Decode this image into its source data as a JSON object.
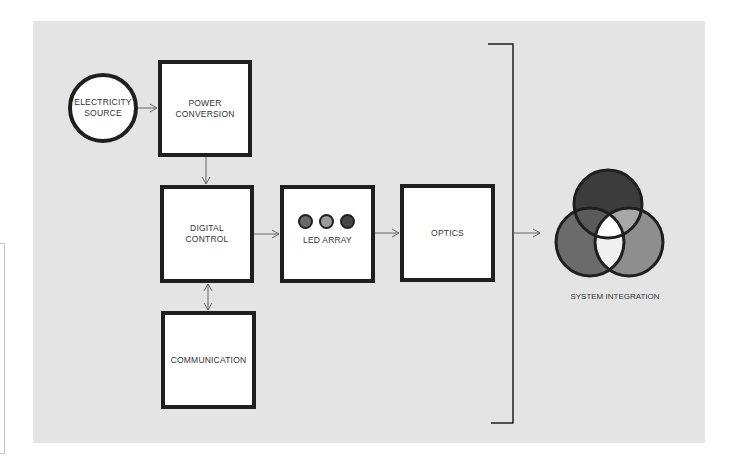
{
  "diagram": {
    "nodes": {
      "electricity_source": {
        "label": "ELECTRICITY\nSOURCE",
        "shape": "circle"
      },
      "power_conversion": {
        "label": "POWER\nCONVERSION",
        "shape": "box"
      },
      "digital_control": {
        "label": "DIGITAL\nCONTROL",
        "shape": "box"
      },
      "communication": {
        "label": "COMMUNICATION",
        "shape": "box"
      },
      "led_array": {
        "label": "LED ARRAY",
        "shape": "box",
        "led_colors": [
          "#6a6a6a",
          "#9a9a9a",
          "#454545"
        ]
      },
      "optics": {
        "label": "OPTICS",
        "shape": "box"
      },
      "system_integration": {
        "label": "SYSTEM INTEGRATION",
        "shape": "venn",
        "colors": {
          "top": "#3c3c3c",
          "left": "#6b6b6b",
          "right": "#8e8e8e",
          "top_left": "#5a5a5a",
          "top_right": "#a8a8a8",
          "center": "#ffffff",
          "bottom": "#f0f0f0"
        }
      }
    },
    "edges": [
      {
        "from": "electricity_source",
        "to": "power_conversion",
        "type": "arrow"
      },
      {
        "from": "power_conversion",
        "to": "digital_control",
        "type": "arrow"
      },
      {
        "from": "digital_control",
        "to": "communication",
        "type": "bidirectional"
      },
      {
        "from": "digital_control",
        "to": "led_array",
        "type": "arrow"
      },
      {
        "from": "led_array",
        "to": "optics",
        "type": "arrow"
      },
      {
        "from": "bracket",
        "to": "system_integration",
        "type": "arrow"
      }
    ]
  },
  "colors": {
    "panel_background": "#e4e4e4",
    "stroke": "#1f1f1f",
    "arrow": "#666666"
  }
}
